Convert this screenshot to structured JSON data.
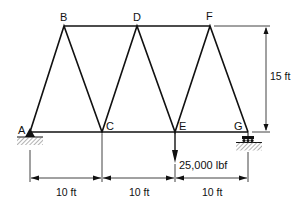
{
  "diagram": {
    "type": "truss",
    "joints": [
      {
        "id": "A",
        "label": "A"
      },
      {
        "id": "B",
        "label": "B"
      },
      {
        "id": "C",
        "label": "C"
      },
      {
        "id": "D",
        "label": "D"
      },
      {
        "id": "E",
        "label": "E"
      },
      {
        "id": "F",
        "label": "F"
      },
      {
        "id": "G",
        "label": "G"
      }
    ],
    "members": [
      "AB",
      "BC",
      "CD",
      "DE",
      "EF",
      "FG",
      "BD",
      "DF",
      "AC",
      "CE",
      "EG"
    ],
    "supports": {
      "A": "pin",
      "G": "roller"
    },
    "load": {
      "joint": "E",
      "label": "25,000 lbf",
      "direction": "down"
    },
    "dimensions": {
      "height": "15 ft",
      "spans": [
        "10 ft",
        "10 ft",
        "10 ft"
      ]
    },
    "colors": {
      "line": "#111111",
      "hatch": "#555555"
    }
  }
}
